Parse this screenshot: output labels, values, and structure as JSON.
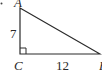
{
  "figure": {
    "type": "right-triangle",
    "vertices": {
      "A": {
        "label": "A",
        "x": 20,
        "y": 8
      },
      "C": {
        "label": "C",
        "x": 20,
        "y": 54
      },
      "B": {
        "label": "B",
        "x": 100,
        "y": 54
      }
    },
    "sides": {
      "AC": {
        "label": "7"
      },
      "CB": {
        "label": "12"
      }
    },
    "right_angle_at": "C",
    "bullet": "•",
    "colors": {
      "stroke": "#2a2a2a",
      "background": "#ffffff"
    }
  }
}
